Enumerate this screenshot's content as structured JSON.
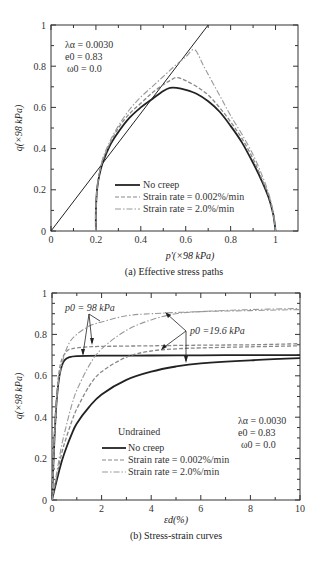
{
  "chart_data": [
    {
      "id": "a",
      "type": "line",
      "caption": "(a) Effective stress paths",
      "xlabel": "p′(×98 kPa)",
      "ylabel": "q(×98 kPa)",
      "xlim": [
        0,
        1.1
      ],
      "ylim": [
        0,
        1.0
      ],
      "xticks": [
        "0",
        "0.2",
        "0.4",
        "0.6",
        "0.8",
        "1"
      ],
      "yticks": [
        "0",
        "0.2",
        "0.4",
        "0.6",
        "0.8",
        "1"
      ],
      "grid": false,
      "parameters": [
        "λα = 0.0030",
        "e0 = 0.83",
        "ω0 = 0.0"
      ],
      "legend": {
        "position": "lower-center",
        "entries": [
          "No creep",
          "Strain rate = 0.002%/min",
          "Strain rate = 2.0%/min"
        ]
      },
      "reference_line": {
        "name": "Critical state line",
        "x": [
          0,
          0.7
        ],
        "y": [
          0,
          1.0
        ]
      },
      "series": [
        {
          "name": "No creep",
          "style": "solid",
          "x": [
            0.2,
            0.2,
            0.205,
            0.215,
            0.23,
            0.26,
            0.3,
            0.35,
            0.4,
            0.45,
            0.5,
            0.53,
            0.56,
            0.6,
            0.65,
            0.7,
            0.75,
            0.8,
            0.85,
            0.9,
            0.94,
            0.97,
            0.99,
            1.0
          ],
          "y": [
            0.0,
            0.1,
            0.2,
            0.27,
            0.33,
            0.41,
            0.48,
            0.55,
            0.6,
            0.64,
            0.68,
            0.695,
            0.695,
            0.685,
            0.665,
            0.63,
            0.58,
            0.51,
            0.43,
            0.33,
            0.24,
            0.16,
            0.08,
            0.0
          ]
        },
        {
          "name": "Strain rate = 0.002%/min",
          "style": "dashed",
          "x": [
            0.2,
            0.2,
            0.205,
            0.215,
            0.23,
            0.26,
            0.3,
            0.35,
            0.4,
            0.45,
            0.5,
            0.53,
            0.56,
            0.6,
            0.65,
            0.7,
            0.75,
            0.8,
            0.85,
            0.9,
            0.94,
            0.97,
            0.99,
            1.0
          ],
          "y": [
            0.0,
            0.1,
            0.2,
            0.28,
            0.34,
            0.42,
            0.5,
            0.57,
            0.62,
            0.67,
            0.71,
            0.73,
            0.745,
            0.73,
            0.7,
            0.66,
            0.6,
            0.53,
            0.45,
            0.35,
            0.25,
            0.17,
            0.08,
            0.0
          ]
        },
        {
          "name": "Strain rate = 2.0%/min",
          "style": "dashdot",
          "x": [
            0.2,
            0.2,
            0.205,
            0.215,
            0.23,
            0.26,
            0.3,
            0.35,
            0.4,
            0.45,
            0.5,
            0.55,
            0.6,
            0.64,
            0.68,
            0.72,
            0.76,
            0.8,
            0.85,
            0.9,
            0.94,
            0.97,
            0.99,
            1.0
          ],
          "y": [
            0.0,
            0.1,
            0.2,
            0.28,
            0.35,
            0.43,
            0.51,
            0.59,
            0.65,
            0.7,
            0.75,
            0.8,
            0.845,
            0.88,
            0.8,
            0.72,
            0.64,
            0.56,
            0.47,
            0.37,
            0.27,
            0.18,
            0.09,
            0.0
          ]
        }
      ]
    },
    {
      "id": "b",
      "type": "line",
      "caption": "(b) Stress-strain curves",
      "xlabel": "εd(%)",
      "ylabel": "q(×98 kPa)",
      "xlim": [
        0,
        10
      ],
      "ylim": [
        0,
        1.0
      ],
      "xticks": [
        "0",
        "2",
        "4",
        "6",
        "8",
        "10"
      ],
      "yticks": [
        "0",
        "0.2",
        "0.4",
        "0.6",
        "0.8",
        "1"
      ],
      "grid": false,
      "parameters": [
        "λα = 0.0030",
        "e0 = 0.83",
        "ω0 = 0.0"
      ],
      "legend": {
        "title": "Undrained",
        "position": "lower-center",
        "entries": [
          "No creep",
          "Strain rate = 0.002%/min",
          "Strain rate = 2.0%/min"
        ]
      },
      "annotations": [
        {
          "text": "p0 = 98 kPa",
          "x": 0.9,
          "y": 0.93
        },
        {
          "text": "p0 =19.6 kPa",
          "x": 5.7,
          "y": 0.81
        }
      ],
      "series": [
        {
          "name": "No creep (p0 = 98 kPa)",
          "style": "solid",
          "x": [
            0,
            0.1,
            0.2,
            0.3,
            0.4,
            0.5,
            0.7,
            1.0,
            2.0,
            4.0,
            6.0,
            8.0,
            10.0
          ],
          "y": [
            0,
            0.3,
            0.5,
            0.6,
            0.65,
            0.675,
            0.69,
            0.695,
            0.697,
            0.698,
            0.699,
            0.7,
            0.7
          ]
        },
        {
          "name": "Strain rate = 0.002%/min (p0 = 98 kPa)",
          "style": "dashed",
          "x": [
            0,
            0.1,
            0.2,
            0.3,
            0.4,
            0.6,
            0.8,
            1.0,
            1.5,
            2.0,
            4.0,
            6.0,
            8.0,
            10.0
          ],
          "y": [
            0,
            0.32,
            0.52,
            0.63,
            0.68,
            0.72,
            0.73,
            0.735,
            0.74,
            0.742,
            0.745,
            0.748,
            0.75,
            0.755
          ]
        },
        {
          "name": "Strain rate = 2.0%/min (p0 = 98 kPa)",
          "style": "dashdot",
          "x": [
            0,
            0.1,
            0.2,
            0.3,
            0.5,
            0.7,
            1.0,
            1.5,
            2.0,
            3.0,
            4.0,
            6.0,
            8.0,
            10.0
          ],
          "y": [
            0,
            0.3,
            0.5,
            0.6,
            0.7,
            0.76,
            0.8,
            0.84,
            0.86,
            0.89,
            0.9,
            0.91,
            0.915,
            0.92
          ]
        },
        {
          "name": "No creep (p0 = 19.6 kPa)",
          "style": "solid",
          "x": [
            0,
            0.2,
            0.4,
            0.6,
            0.8,
            1.0,
            1.5,
            2.0,
            3.0,
            4.0,
            5.0,
            6.0,
            8.0,
            10.0
          ],
          "y": [
            0,
            0.1,
            0.19,
            0.26,
            0.32,
            0.37,
            0.45,
            0.51,
            0.58,
            0.62,
            0.645,
            0.66,
            0.675,
            0.685
          ]
        },
        {
          "name": "Strain rate = 0.002%/min (p0 = 19.6 kPa)",
          "style": "dashed",
          "x": [
            0,
            0.2,
            0.4,
            0.6,
            0.8,
            1.0,
            1.5,
            2.0,
            3.0,
            4.0,
            5.0,
            6.0,
            8.0,
            10.0
          ],
          "y": [
            0,
            0.12,
            0.23,
            0.31,
            0.38,
            0.44,
            0.55,
            0.62,
            0.69,
            0.72,
            0.73,
            0.735,
            0.74,
            0.745
          ]
        },
        {
          "name": "Strain rate = 2.0%/min (p0 = 19.6 kPa)",
          "style": "dashdot",
          "x": [
            0,
            0.2,
            0.4,
            0.6,
            0.8,
            1.0,
            1.5,
            2.0,
            3.0,
            4.0,
            5.0,
            6.0,
            8.0,
            10.0
          ],
          "y": [
            0,
            0.14,
            0.27,
            0.37,
            0.46,
            0.53,
            0.65,
            0.73,
            0.82,
            0.87,
            0.9,
            0.91,
            0.92,
            0.925
          ]
        }
      ]
    }
  ]
}
